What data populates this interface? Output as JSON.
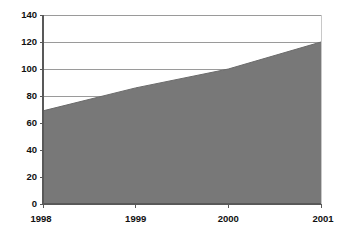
{
  "chart_data": {
    "type": "area",
    "title": "",
    "subtitle": "",
    "xlabel": "",
    "ylabel": "",
    "categories": [
      "1998",
      "1999",
      "2000",
      "2001"
    ],
    "x": [
      1998,
      1999,
      2000,
      2001
    ],
    "values": [
      69,
      86,
      100,
      120
    ],
    "series": [
      {
        "name": "Series 1",
        "values": [
          69,
          86,
          100,
          120
        ]
      }
    ],
    "ylim": [
      0,
      140
    ],
    "xlim": [
      "1998",
      "2001"
    ],
    "y_ticks": [
      0,
      20,
      40,
      60,
      80,
      100,
      120,
      140
    ],
    "y_tick_labels": [
      "0",
      "20",
      "40",
      "60",
      "80",
      "100",
      "120",
      "140"
    ],
    "x_ticks": [
      "1998",
      "1999",
      "2000",
      "2001"
    ],
    "x_tick_labels": [
      "1998",
      "1999",
      "2000",
      "2001"
    ],
    "grid": true,
    "grid_axis": "y",
    "legend": false,
    "legend_position": "none",
    "annotations": []
  },
  "style": {
    "background_color": "#ffffff",
    "area_fill_color": "#787878",
    "area_line_color": "#6b6b6b",
    "gridline_color": "#9a9a9a",
    "axis_color": "#595959",
    "tick_label_color": "#111111"
  }
}
